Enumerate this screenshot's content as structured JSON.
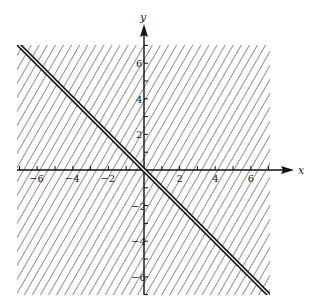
{
  "chart_data": {
    "type": "line",
    "title": "",
    "xlabel": "x",
    "ylabel": "y",
    "xlim": [
      -7,
      7
    ],
    "ylim": [
      -7,
      7
    ],
    "grid": false,
    "legend": null,
    "x_ticks": [
      -6,
      -4,
      -2,
      2,
      4,
      6
    ],
    "y_ticks": [
      -6,
      -4,
      -2,
      2,
      4,
      6
    ],
    "x_tick_labels": [
      "−6",
      "−4",
      "−2",
      "2",
      "4",
      "6"
    ],
    "y_tick_labels": [
      "−6",
      "−4",
      "−2",
      "2",
      "4",
      "6"
    ],
    "minor_ticks_every": 1,
    "series": [
      {
        "name": "boundary line y = -x",
        "style": "double solid line",
        "x": [
          -7,
          7
        ],
        "y": [
          7,
          -7
        ]
      }
    ],
    "shaded_region": {
      "description": "entire plane hatched (diagonal hatching) over x in [-7,7], y in [-7,7]",
      "x_range": [
        -7,
        7
      ],
      "y_range": [
        -7,
        7
      ],
      "pattern": "diagonal-hatch"
    }
  },
  "axes": {
    "x_label": "x",
    "y_label": "y"
  }
}
